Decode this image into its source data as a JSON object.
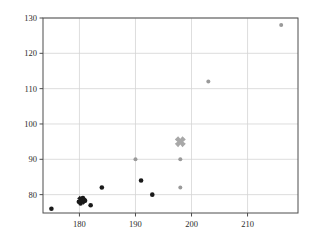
{
  "chart_data": {
    "type": "scatter",
    "title": "",
    "xlabel": "",
    "ylabel": "",
    "xlim": [
      173.5,
      219.0
    ],
    "ylim": [
      74.8,
      130.0
    ],
    "grid": true,
    "legend": "none",
    "xticks": [
      180,
      190,
      200,
      210
    ],
    "yticks": [
      80,
      90,
      100,
      110,
      120,
      130
    ],
    "xtick_labels": [
      "180",
      "190",
      "200",
      "210"
    ],
    "ytick_labels": [
      "80",
      "90",
      "100",
      "110",
      "120",
      "130"
    ],
    "series": [
      {
        "name": "black-circles",
        "marker": "circle",
        "color": "#1a1a1a",
        "size": 4.6,
        "points": [
          {
            "x": 175.0,
            "y": 76.0
          },
          {
            "x": 179.9,
            "y": 78.0
          },
          {
            "x": 180.2,
            "y": 77.5
          },
          {
            "x": 180.6,
            "y": 79.0
          },
          {
            "x": 181.0,
            "y": 78.3
          },
          {
            "x": 182.0,
            "y": 77.0
          },
          {
            "x": 184.0,
            "y": 82.0
          },
          {
            "x": 191.0,
            "y": 84.0
          },
          {
            "x": 193.0,
            "y": 80.0
          }
        ]
      },
      {
        "name": "black-x-mean",
        "marker": "x-thick",
        "color": "#1a1a1a",
        "size": 9.0,
        "points": [
          {
            "x": 180.4,
            "y": 78.4
          }
        ]
      },
      {
        "name": "gray-circles",
        "marker": "circle",
        "color": "#9a9a9a",
        "size": 4.0,
        "points": [
          {
            "x": 190.0,
            "y": 90.0
          },
          {
            "x": 198.0,
            "y": 90.0
          },
          {
            "x": 198.0,
            "y": 82.0
          },
          {
            "x": 203.0,
            "y": 112.0
          },
          {
            "x": 216.0,
            "y": 128.0
          }
        ]
      },
      {
        "name": "gray-x-mean",
        "marker": "x-thick",
        "color": "#a8a8a8",
        "size": 11.0,
        "points": [
          {
            "x": 198.0,
            "y": 95.0
          }
        ]
      }
    ],
    "colors": {
      "axis": "#4d4d4d",
      "grid": "#d4d4d4",
      "background": "#ffffff",
      "black_marker": "#1a1a1a",
      "gray_marker": "#9a9a9a"
    }
  },
  "axes": {
    "x_axis_name": "x-axis",
    "y_axis_name": "y-axis"
  }
}
